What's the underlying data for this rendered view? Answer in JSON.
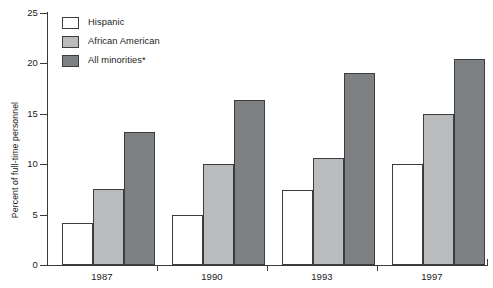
{
  "chart_data": {
    "type": "bar",
    "title": "",
    "xlabel": "",
    "ylabel": "Percent of full-time personnel",
    "categories": [
      "1987",
      "1990",
      "1993",
      "1997"
    ],
    "series": [
      {
        "name": "Hispanic",
        "color": "#ffffff",
        "values": [
          4.2,
          5.0,
          7.4,
          10.0
        ]
      },
      {
        "name": "African American",
        "color": "#b9bbbd",
        "values": [
          7.5,
          10.0,
          10.6,
          15.0
        ]
      },
      {
        "name": "All minorities*",
        "color": "#7e8184",
        "values": [
          13.2,
          16.4,
          19.0,
          20.4
        ]
      }
    ],
    "ylim": [
      0,
      25
    ],
    "yticks": [
      0,
      5,
      10,
      15,
      20,
      25
    ],
    "ytick_labels": [
      "0",
      "5",
      "10",
      "15",
      "20",
      "25"
    ],
    "grid": false,
    "legend_position": "top-left",
    "axis_color": "#3a3a3a",
    "bar_edge_color": "#3c3c3c"
  },
  "legend": {
    "items": [
      {
        "label": "Hispanic"
      },
      {
        "label": "African American"
      },
      {
        "label": "All minorities*"
      }
    ]
  }
}
